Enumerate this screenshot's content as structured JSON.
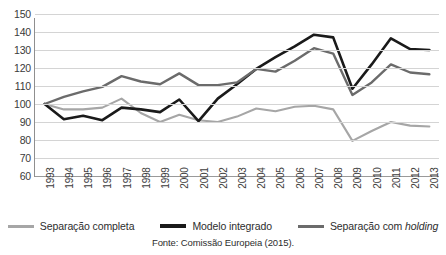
{
  "chart_data": {
    "type": "line",
    "title": "",
    "subtitle": "",
    "xlabel": "",
    "ylabel": "",
    "ylim": [
      60,
      150
    ],
    "ytick_step": 10,
    "yticks": [
      150,
      140,
      130,
      120,
      110,
      100,
      90,
      80,
      70,
      60
    ],
    "grid": true,
    "legend_position": "bottom",
    "categories": [
      "1993",
      "1994",
      "1995",
      "1996",
      "1997",
      "1998",
      "1999",
      "2000",
      "2001",
      "2002",
      "2003",
      "2004",
      "2005",
      "2006",
      "2007",
      "2008",
      "2009",
      "2010",
      "2011",
      "2012",
      "2013"
    ],
    "series": [
      {
        "name": "Separação completa",
        "color": "#a6a6a6",
        "width": 2.1,
        "values": [
          100,
          97,
          97,
          98,
          103,
          95,
          90,
          94,
          91,
          90,
          93,
          97.5,
          96,
          98.5,
          99,
          97,
          79.5,
          85,
          90,
          88,
          87.5
        ]
      },
      {
        "name": "Modelo integrado",
        "color": "#1a1a1a",
        "width": 2.6,
        "values": [
          100,
          91.5,
          93.5,
          91,
          98,
          97,
          95.5,
          102.5,
          90.5,
          103,
          111,
          119.5,
          126,
          132,
          138.5,
          137,
          108.5,
          122,
          136.5,
          130.5,
          130
        ]
      },
      {
        "name": "Separação com holding",
        "color": "#6b6b6b",
        "width": 2.4,
        "values": [
          100,
          104,
          107,
          109.5,
          115.5,
          112.5,
          111,
          117,
          110.5,
          110.5,
          112,
          119.5,
          118,
          124,
          131,
          128,
          105,
          112,
          122,
          117.5,
          116.5
        ]
      }
    ],
    "annotations": []
  },
  "legend": {
    "items": [
      {
        "label": "Separação completa",
        "label_italic": "",
        "color": "#a6a6a6",
        "icon": "line-swatch-light"
      },
      {
        "label": "Modelo integrado",
        "label_italic": "",
        "color": "#1a1a1a",
        "icon": "line-swatch-black"
      },
      {
        "label": "Separação com ",
        "label_italic": "holding",
        "color": "#6b6b6b",
        "icon": "line-swatch-gray"
      }
    ]
  },
  "source_note": "Fonte: Comissão Europeia (2015).",
  "colors": {
    "gridline": "#d4d4d4",
    "axis": "#8f8f8f",
    "text": "#2d2d2d",
    "background": "#ffffff"
  }
}
